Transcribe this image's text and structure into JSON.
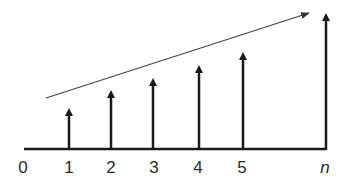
{
  "diagram": {
    "type": "growing-impulse-sequence",
    "axis_labels": [
      "0",
      "1",
      "2",
      "3",
      "4",
      "5",
      "n"
    ],
    "impulses": [
      {
        "label": "1",
        "x": 69,
        "top": 109
      },
      {
        "label": "2",
        "x": 111,
        "top": 91
      },
      {
        "label": "3",
        "x": 153,
        "top": 79
      },
      {
        "label": "4",
        "x": 199,
        "top": 66
      },
      {
        "label": "5",
        "x": 243,
        "top": 53
      },
      {
        "label": "n",
        "x": 326,
        "top": 14
      }
    ],
    "trend_arrow": {
      "from": [
        46,
        98
      ],
      "to": [
        309,
        13
      ]
    },
    "colors": {
      "stroke": "#1a1a1a",
      "trend": "#444444"
    }
  }
}
